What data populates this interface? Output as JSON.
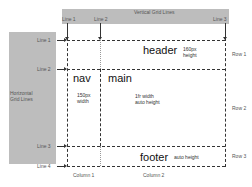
{
  "vertical_band": {
    "title": "Vertical Grid Lines",
    "lines": [
      {
        "label": "Line 1"
      },
      {
        "label": "Line 2"
      },
      {
        "label": "Line 3"
      }
    ]
  },
  "horizontal_band": {
    "title_line1": "Horizontal",
    "title_line2": "Grid Lines",
    "lines": [
      {
        "label": "Line 1"
      },
      {
        "label": "Line 2"
      },
      {
        "label": "Line 3"
      },
      {
        "label": "Line 4"
      }
    ]
  },
  "areas": {
    "header": {
      "name": "header",
      "note_line1": "160px",
      "note_line2": "height"
    },
    "nav": {
      "name": "nav",
      "note_line1": "150px",
      "note_line2": "width"
    },
    "main": {
      "name": "main",
      "note_line1": "1fr width",
      "note_line2": "auto height"
    },
    "footer": {
      "name": "footer",
      "note": "auto height"
    }
  },
  "rows": [
    {
      "label": "Row 1"
    },
    {
      "label": "Row 2"
    },
    {
      "label": "Row 3"
    }
  ],
  "columns": [
    {
      "label": "Column 1"
    },
    {
      "label": "Column 2"
    }
  ]
}
